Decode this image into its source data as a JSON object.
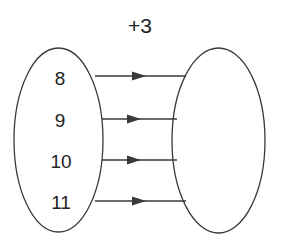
{
  "diagram": {
    "title_label": "+3",
    "stroke_color": "#3a3a3a",
    "text_color": "#232323",
    "background_color": "#ffffff",
    "domain": {
      "name": "input-set-ellipse",
      "elements": [
        {
          "label": "8"
        },
        {
          "label": "9"
        },
        {
          "label": "10"
        },
        {
          "label": "11"
        }
      ]
    },
    "codomain": {
      "name": "output-set-ellipse",
      "elements": []
    },
    "arrows": [
      {
        "from": "8",
        "to": ""
      },
      {
        "from": "9",
        "to": ""
      },
      {
        "from": "10",
        "to": ""
      },
      {
        "from": "11",
        "to": ""
      }
    ]
  }
}
